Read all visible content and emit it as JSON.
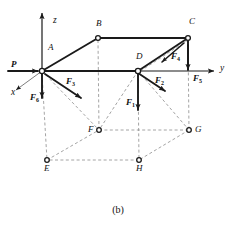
{
  "figure": {
    "caption": "(b)",
    "axes": [
      {
        "name": "z",
        "label": "z",
        "direction": "up"
      },
      {
        "name": "y",
        "label": "y",
        "direction": "right"
      },
      {
        "name": "x",
        "label": "x",
        "direction": "down-left"
      }
    ],
    "vertices": [
      {
        "id": "A",
        "label": "A",
        "x": 42,
        "y": 71,
        "label_dx": 6,
        "label_dy": -14,
        "marker": true
      },
      {
        "id": "B",
        "label": "B",
        "x": 98,
        "y": 38,
        "label_dx": -2,
        "label_dy": -14,
        "marker": true
      },
      {
        "id": "C",
        "label": "C",
        "x": 188,
        "y": 38,
        "label_dx": 1,
        "label_dy": -14,
        "marker": true
      },
      {
        "id": "D",
        "label": "D",
        "x": 138,
        "y": 71,
        "label_dx": -2,
        "label_dy": -14,
        "marker": true
      },
      {
        "id": "E",
        "label": "E",
        "x": 47,
        "y": 160,
        "label_dx": -3,
        "label_dy": 7,
        "marker": true
      },
      {
        "id": "F",
        "label": "F",
        "x": 99,
        "y": 130,
        "label_dx": -11,
        "label_dy": -4,
        "marker": true
      },
      {
        "id": "G",
        "label": "G",
        "x": 189,
        "y": 130,
        "label_dx": 6,
        "label_dy": -4,
        "marker": true
      },
      {
        "id": "H",
        "label": "H",
        "x": 139,
        "y": 160,
        "label_dx": -3,
        "label_dy": 7,
        "marker": true
      }
    ],
    "forces": [
      {
        "id": "P",
        "label": "P",
        "sub": "",
        "label_x": 11,
        "label_y": 61,
        "style": "bold-italic"
      },
      {
        "id": "F1",
        "label": "F",
        "sub": "1",
        "label_x": 126,
        "label_y": 100,
        "style": "bold-italic"
      },
      {
        "id": "F2",
        "label": "F",
        "sub": "2",
        "label_x": 155,
        "label_y": 78,
        "style": "bold-italic"
      },
      {
        "id": "F3",
        "label": "F",
        "sub": "3",
        "label_x": 66,
        "label_y": 79,
        "style": "bold-italic"
      },
      {
        "id": "F4",
        "label": "F",
        "sub": "4",
        "label_x": 171,
        "label_y": 54,
        "style": "bold-italic"
      },
      {
        "id": "F5",
        "label": "F",
        "sub": "5",
        "label_x": 193,
        "label_y": 76,
        "style": "bold-italic"
      },
      {
        "id": "F6",
        "label": "F",
        "sub": "6",
        "label_x": 30,
        "label_y": 95,
        "style": "bold-italic"
      }
    ],
    "colors": {
      "line": "#1a1a1a",
      "dashed": "#8d8d8d",
      "background": "#ffffff",
      "text": "#111111"
    }
  }
}
